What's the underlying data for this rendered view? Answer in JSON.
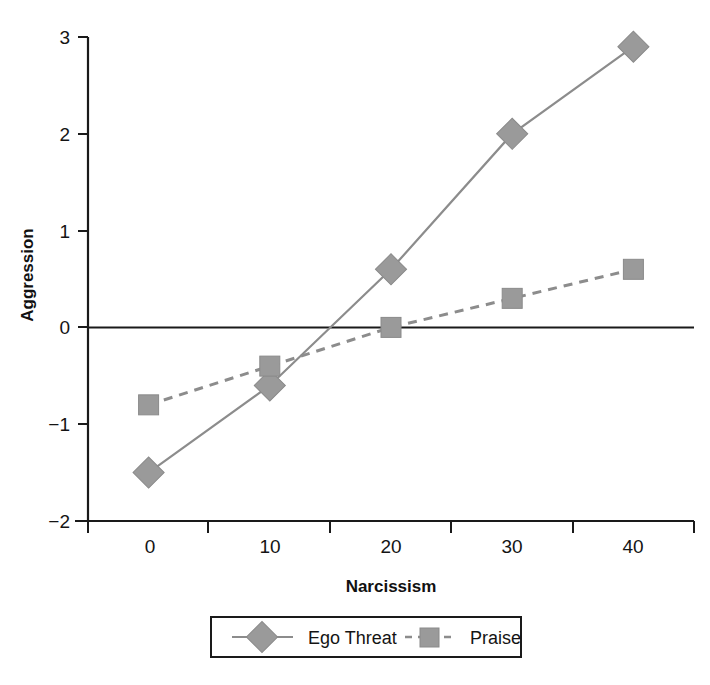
{
  "chart_data": {
    "type": "line",
    "title": "",
    "xlabel": "Narcissism",
    "ylabel": "Aggression",
    "x": [
      0,
      10,
      20,
      30,
      40
    ],
    "xticklabels": [
      "0",
      "10",
      "20",
      "30",
      "40"
    ],
    "yticklabels": [
      "3",
      "2",
      "1",
      "0",
      "−1",
      "−2"
    ],
    "yticks": [
      3,
      2,
      1,
      0,
      -1,
      -2
    ],
    "xlim": [
      -5,
      45
    ],
    "ylim": [
      -2,
      3
    ],
    "grid": false,
    "zero_line": true,
    "legend_position": "bottom-outside",
    "series": [
      {
        "name": "Ego Threat",
        "values": [
          -1.5,
          -0.6,
          0.6,
          2.0,
          2.9
        ],
        "marker": "diamond",
        "linestyle": "solid",
        "color": "#8c8c8c",
        "marker_color": "#9a9a9a"
      },
      {
        "name": "Praise",
        "values": [
          -0.8,
          -0.4,
          0.0,
          0.3,
          0.6
        ],
        "marker": "square",
        "linestyle": "dashed",
        "color": "#8c8c8c",
        "marker_color": "#9a9a9a"
      }
    ]
  },
  "legend": {
    "entries": [
      {
        "label": "Ego Threat",
        "marker": "diamond",
        "linestyle": "solid"
      },
      {
        "label": "Praise",
        "marker": "square",
        "linestyle": "dashed"
      }
    ]
  },
  "colors": {
    "axis": "#1a1a1a",
    "series_line": "#8c8c8c",
    "marker_fill": "#9a9a9a",
    "marker_stroke": "#8a8a8a",
    "legend_border": "#1a1a1a",
    "background": "#ffffff"
  }
}
